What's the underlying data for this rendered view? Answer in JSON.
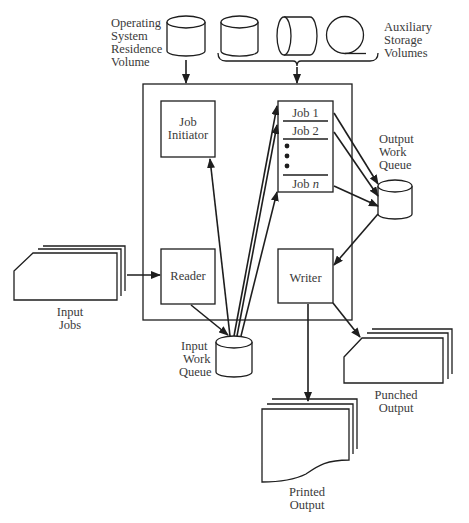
{
  "diagram": {
    "os_volume": {
      "lines": [
        "Operating",
        "System",
        "Residence",
        "Volume"
      ]
    },
    "aux_volumes": {
      "lines": [
        "Auxiliary",
        "Storage",
        "Volumes"
      ]
    },
    "job_initiator": {
      "lines": [
        "Job",
        "Initiator"
      ]
    },
    "job_list": {
      "items": [
        "Job 1",
        "Job 2",
        "Job n"
      ],
      "job_n_prefix": "Job ",
      "job_n_var": "n"
    },
    "output_queue": {
      "lines": [
        "Output",
        "Work",
        "Queue"
      ]
    },
    "reader": {
      "label": "Reader"
    },
    "writer": {
      "label": "Writer"
    },
    "input_jobs": {
      "lines": [
        "Input",
        "Jobs"
      ]
    },
    "input_queue": {
      "lines": [
        "Input",
        "Work",
        "Queue"
      ]
    },
    "punched_output": {
      "lines": [
        "Punched",
        "Output"
      ]
    },
    "printed_output": {
      "lines": [
        "Printed",
        "Output"
      ]
    },
    "colors": {
      "ink": "#1e1e1e",
      "text": "#3a3a3a",
      "background": "#ffffff"
    }
  }
}
